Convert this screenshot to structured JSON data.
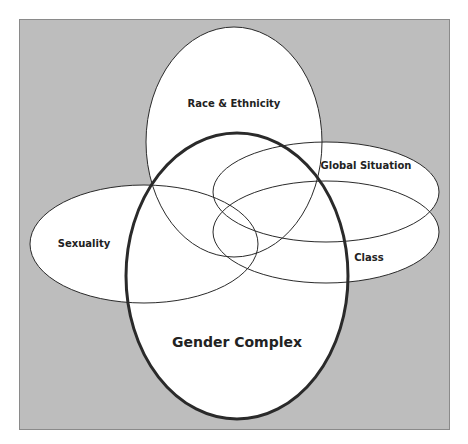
{
  "diagram": {
    "type": "venn-ellipses",
    "background_color": "#bdbdbd",
    "frame_border_color": "#8a8a8a",
    "ellipse_fill": "#ffffff",
    "stroke_color": "#2a2a2a",
    "sets": [
      {
        "id": "race",
        "label": "Race & Ethnicity",
        "emphasis": false
      },
      {
        "id": "global",
        "label": "Global Situation",
        "emphasis": false
      },
      {
        "id": "class",
        "label": "Class",
        "emphasis": false
      },
      {
        "id": "sexuality",
        "label": "Sexuality",
        "emphasis": false
      },
      {
        "id": "gender",
        "label": "Gender Complex",
        "emphasis": true
      }
    ]
  }
}
